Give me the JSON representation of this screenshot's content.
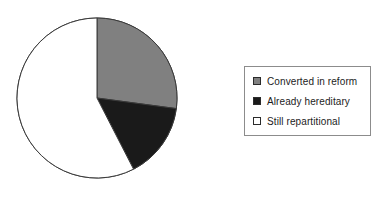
{
  "figure": {
    "background_color": "#ffffff"
  },
  "chart_data": {
    "type": "pie",
    "title": "",
    "subtitle": "",
    "xlabel": "",
    "ylabel": "",
    "grid": false,
    "legend_position": "right",
    "start_angle_deg": 0,
    "direction": "clockwise",
    "center": {
      "x": 97,
      "y": 98
    },
    "radius": 80,
    "outline_color": "#3a3a3a",
    "categories": [
      "Converted in reform",
      "Already hereditary",
      "Still repartitional"
    ],
    "values": [
      27,
      15,
      58
    ],
    "value_unit": "percent",
    "colors": [
      "#808080",
      "#1a1a1a",
      "#ffffff"
    ],
    "slices": [
      {
        "label": "Converted in reform",
        "value": 27,
        "color": "#808080",
        "start_angle_deg": 0,
        "end_angle_deg": 97.6
      },
      {
        "label": "Already hereditary",
        "value": 15,
        "color": "#1a1a1a",
        "start_angle_deg": 97.6,
        "end_angle_deg": 152.8
      },
      {
        "label": "Still repartitional",
        "value": 58,
        "color": "#ffffff",
        "start_angle_deg": 152.8,
        "end_angle_deg": 360
      }
    ]
  },
  "legend": {
    "border_color": "#8c8c8c",
    "background_color": "#ffffff",
    "items": [
      {
        "label": "Converted in reform",
        "swatch_color": "#808080",
        "swatch_border": "#2b2b2b"
      },
      {
        "label": "Already hereditary",
        "swatch_color": "#1a1a1a",
        "swatch_border": "#2b2b2b"
      },
      {
        "label": "Still repartitional",
        "swatch_color": "#ffffff",
        "swatch_border": "#2b2b2b"
      }
    ]
  }
}
